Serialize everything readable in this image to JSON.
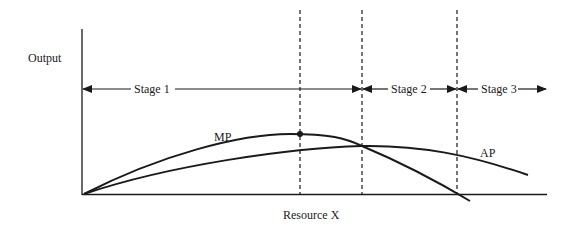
{
  "diagram": {
    "y_axis_label": "Output",
    "x_axis_label": "Resource X",
    "curves": [
      {
        "name": "MP",
        "label": "MP",
        "description": "Marginal product curve, rises then falls, crosses AP at AP's maximum, reaches zero at end of Stage 2"
      },
      {
        "name": "AP",
        "label": "AP",
        "description": "Average product curve, rises to maximum at Stage 1/2 boundary then declines"
      }
    ],
    "stages": [
      {
        "label": "Stage 1",
        "from": "origin",
        "to": "AP maximum (MP = AP)"
      },
      {
        "label": "Stage 2",
        "from": "AP maximum",
        "to": "MP = 0"
      },
      {
        "label": "Stage 3",
        "from": "MP = 0",
        "to": "beyond"
      }
    ],
    "markers": [
      {
        "type": "dashed-line",
        "at": "MP maximum (inflection point)"
      },
      {
        "type": "dashed-line",
        "at": "MP = AP"
      },
      {
        "type": "dashed-line",
        "at": "MP = 0"
      },
      {
        "type": "point",
        "at": "MP maximum"
      }
    ],
    "colors": {
      "ink": "#1a1a1a",
      "background": "#ffffff"
    }
  }
}
